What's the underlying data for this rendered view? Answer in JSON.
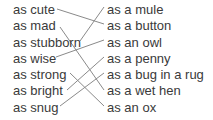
{
  "left_items": [
    "as cute",
    "as mad",
    "as stubborn",
    "as wise",
    "as strong",
    "as bright",
    "as snug"
  ],
  "right_items": [
    "as a mule",
    "as a button",
    "as an owl",
    "as a penny",
    "as a bug in a rug",
    "as a wet hen",
    "as an ox"
  ],
  "matches": [
    {
      "left": "as cute",
      "right": "as a button"
    },
    {
      "left": "as mad",
      "right": "as a wet hen"
    },
    {
      "left": "as stubborn",
      "right": "as a mule"
    },
    {
      "left": "as wise",
      "right": "as an owl"
    },
    {
      "left": "as strong",
      "right": "as an ox"
    },
    {
      "left": "as bright",
      "right": "as a penny"
    },
    {
      "left": "as snug",
      "right": "as a bug in a rug"
    }
  ],
  "colors": {
    "text": "#3a3a3a",
    "line": "#8a8a8a"
  }
}
